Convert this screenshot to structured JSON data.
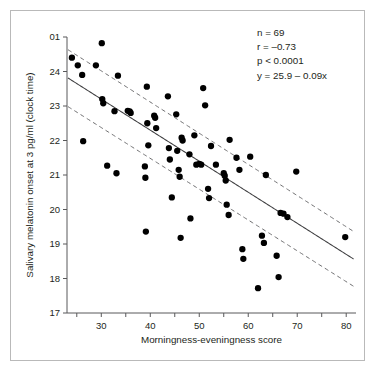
{
  "figure": {
    "background": "#ffffff",
    "border_color": "#b9b9b9",
    "point_color": "#000000",
    "line_color": "#3f3f41",
    "ci_color": "#6e6e70",
    "axis_color": "#58585a"
  },
  "annotations": {
    "n": "n = 69",
    "r": "r = –0.73",
    "p": "p < 0.0001",
    "equation": "y = 25.9 – 0.09x"
  },
  "chart_data": {
    "type": "scatter",
    "title": "",
    "xlabel": "Morningness-eveningness score",
    "ylabel": "Salivary melatonin onset at 3 pg/ml (clock time)",
    "xlim": [
      23,
      82
    ],
    "ylim": [
      17,
      25
    ],
    "grid": false,
    "legend": "none",
    "xticks": [
      30,
      40,
      50,
      60,
      70,
      80
    ],
    "xticklabels": [
      "30",
      "40",
      "50",
      "60",
      "70",
      "80"
    ],
    "xminorticks": [
      25,
      35,
      45,
      55,
      65,
      75
    ],
    "yticks": [
      17,
      18,
      19,
      20,
      21,
      22,
      23,
      24,
      25
    ],
    "yticklabels": [
      "17",
      "18",
      "19",
      "20",
      "21",
      "22",
      "23",
      "24",
      "01"
    ],
    "n": 69,
    "r": -0.73,
    "p": "< 0.0001",
    "fit": {
      "intercept": 25.9,
      "slope": -0.09,
      "equation": "y = 25.9 – 0.09x",
      "x_start": 23.2,
      "x_end": 81.5
    },
    "confidence_band": {
      "style": "dashed",
      "upper_offset_at_xmin": 0.82,
      "upper_offset_at_xmax": 0.8,
      "lower_offset_at_xmin": 0.83,
      "lower_offset_at_xmax": 0.79
    },
    "points": [
      {
        "x": 24.0,
        "y": 24.4
      },
      {
        "x": 25.2,
        "y": 24.18
      },
      {
        "x": 26.1,
        "y": 23.9
      },
      {
        "x": 26.3,
        "y": 21.98
      },
      {
        "x": 28.9,
        "y": 24.18
      },
      {
        "x": 30.1,
        "y": 24.82
      },
      {
        "x": 30.2,
        "y": 23.2
      },
      {
        "x": 30.4,
        "y": 23.08
      },
      {
        "x": 31.2,
        "y": 21.27
      },
      {
        "x": 32.7,
        "y": 22.85
      },
      {
        "x": 33.1,
        "y": 21.05
      },
      {
        "x": 33.4,
        "y": 23.88
      },
      {
        "x": 35.4,
        "y": 22.86
      },
      {
        "x": 35.8,
        "y": 22.84
      },
      {
        "x": 36.0,
        "y": 22.8
      },
      {
        "x": 38.9,
        "y": 21.25
      },
      {
        "x": 39.0,
        "y": 20.92
      },
      {
        "x": 39.1,
        "y": 19.36
      },
      {
        "x": 39.3,
        "y": 23.56
      },
      {
        "x": 39.4,
        "y": 22.5
      },
      {
        "x": 39.6,
        "y": 21.86
      },
      {
        "x": 40.8,
        "y": 22.72
      },
      {
        "x": 41.0,
        "y": 22.66
      },
      {
        "x": 41.2,
        "y": 22.36
      },
      {
        "x": 43.6,
        "y": 23.28
      },
      {
        "x": 43.8,
        "y": 21.78
      },
      {
        "x": 44.0,
        "y": 21.45
      },
      {
        "x": 44.4,
        "y": 20.35
      },
      {
        "x": 45.3,
        "y": 22.76
      },
      {
        "x": 45.5,
        "y": 21.7
      },
      {
        "x": 45.8,
        "y": 21.15
      },
      {
        "x": 46.0,
        "y": 20.95
      },
      {
        "x": 46.2,
        "y": 19.18
      },
      {
        "x": 46.4,
        "y": 22.08
      },
      {
        "x": 46.6,
        "y": 22.0
      },
      {
        "x": 48.0,
        "y": 21.6
      },
      {
        "x": 48.2,
        "y": 19.74
      },
      {
        "x": 49.0,
        "y": 22.15
      },
      {
        "x": 49.4,
        "y": 21.3
      },
      {
        "x": 50.0,
        "y": 21.32
      },
      {
        "x": 50.4,
        "y": 21.3
      },
      {
        "x": 50.8,
        "y": 23.52
      },
      {
        "x": 51.2,
        "y": 23.02
      },
      {
        "x": 51.8,
        "y": 20.6
      },
      {
        "x": 52.0,
        "y": 20.33
      },
      {
        "x": 52.4,
        "y": 21.84
      },
      {
        "x": 53.4,
        "y": 21.3
      },
      {
        "x": 55.0,
        "y": 21.05
      },
      {
        "x": 55.2,
        "y": 20.98
      },
      {
        "x": 55.4,
        "y": 20.84
      },
      {
        "x": 55.6,
        "y": 20.14
      },
      {
        "x": 56.0,
        "y": 19.84
      },
      {
        "x": 56.2,
        "y": 22.02
      },
      {
        "x": 57.6,
        "y": 21.5
      },
      {
        "x": 58.2,
        "y": 21.15
      },
      {
        "x": 58.8,
        "y": 18.85
      },
      {
        "x": 59.0,
        "y": 18.57
      },
      {
        "x": 60.4,
        "y": 21.53
      },
      {
        "x": 62.0,
        "y": 17.72
      },
      {
        "x": 62.8,
        "y": 19.24
      },
      {
        "x": 63.2,
        "y": 19.03
      },
      {
        "x": 63.6,
        "y": 21.0
      },
      {
        "x": 65.8,
        "y": 18.66
      },
      {
        "x": 66.2,
        "y": 18.04
      },
      {
        "x": 66.6,
        "y": 19.9
      },
      {
        "x": 67.2,
        "y": 19.88
      },
      {
        "x": 68.0,
        "y": 19.78
      },
      {
        "x": 69.8,
        "y": 21.1
      },
      {
        "x": 79.8,
        "y": 19.2
      }
    ]
  }
}
